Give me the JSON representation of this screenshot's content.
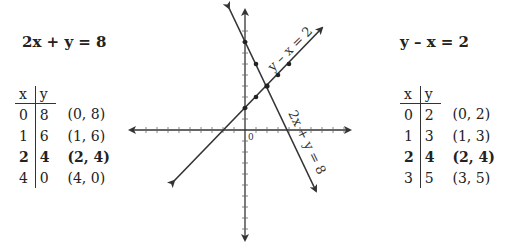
{
  "left": {
    "equation": "2x + y = 8",
    "headers": [
      "x",
      "y"
    ],
    "rows": [
      {
        "x": "0",
        "y": "8",
        "pt": "(0, 8)",
        "bold": false
      },
      {
        "x": "1",
        "y": "6",
        "pt": "(1, 6)",
        "bold": false
      },
      {
        "x": "2",
        "y": "4",
        "pt": "(2, 4)",
        "bold": true
      },
      {
        "x": "4",
        "y": "0",
        "pt": "(4, 0)",
        "bold": false
      }
    ]
  },
  "right": {
    "equation": "y – x = 2",
    "headers": [
      "x",
      "y"
    ],
    "rows": [
      {
        "x": "0",
        "y": "2",
        "pt": "(0, 2)",
        "bold": false
      },
      {
        "x": "1",
        "y": "3",
        "pt": "(1, 3)",
        "bold": false
      },
      {
        "x": "2",
        "y": "4",
        "pt": "(2, 4)",
        "bold": true
      },
      {
        "x": "3",
        "y": "5",
        "pt": "(3, 5)",
        "bold": false
      }
    ]
  },
  "graph": {
    "origin_label": "0",
    "line1_label": "2x + y = 8",
    "line2_label": "y – x = 2",
    "intersection": "(2, 4)",
    "line_color": "#333333"
  }
}
